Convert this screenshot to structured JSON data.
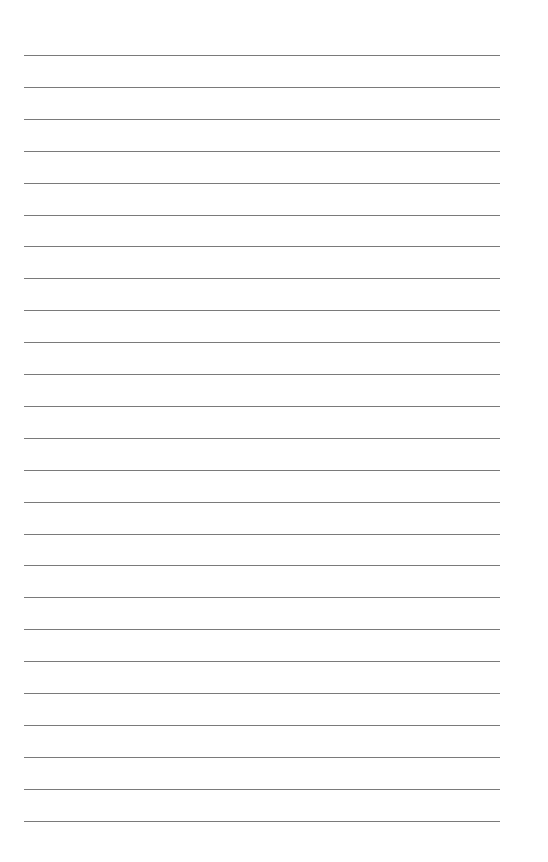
{
  "page": {
    "type": "lined-paper",
    "background_color": "#ffffff",
    "line_color": "#7a7a7a",
    "line_count": 25,
    "first_line_y": 55,
    "line_spacing": 31.9,
    "line_x_start": 24,
    "line_x_end": 500
  }
}
